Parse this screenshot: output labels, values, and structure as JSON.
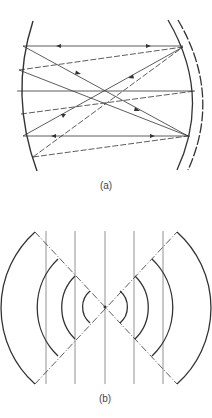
{
  "figure": {
    "panel_a": {
      "label": "(a)",
      "description": "Ray paths bouncing between a concave left mirror and a pair of curved right mirrors"
    },
    "panel_b": {
      "label": "(b)",
      "description": "Vertical parallel lines with two opposing sets of concentric wavefront arcs diverging from a central focal point, bounded by dash-dot diagonals"
    },
    "colors": {
      "line": "#333333",
      "background": "#ffffff"
    }
  }
}
